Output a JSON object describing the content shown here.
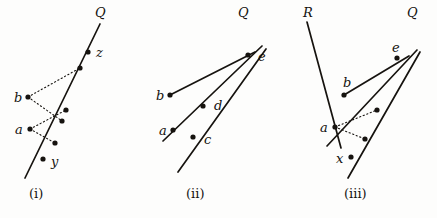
{
  "figure": {
    "width": 437,
    "height": 218,
    "background_color": "#fdfdfc",
    "stroke_color": "#16130f",
    "dot_color": "#16130f",
    "panels": [
      {
        "id": "panel-i",
        "caption": "(i)",
        "caption_pos": {
          "x": 29,
          "y": 187
        },
        "lines": [
          {
            "name": "line-Q",
            "style": "solid",
            "x1": 25,
            "y1": 178,
            "x2": 100,
            "y2": 24
          }
        ],
        "dotted_segments": [
          {
            "name": "dotted-b-to-upper",
            "x1": 28,
            "y1": 97,
            "x2": 80,
            "y2": 68
          },
          {
            "name": "dotted-b-to-lower",
            "x1": 28,
            "y1": 97,
            "x2": 62,
            "y2": 121
          },
          {
            "name": "dotted-a-to-upper",
            "x1": 30,
            "y1": 129,
            "x2": 66,
            "y2": 110
          },
          {
            "name": "dotted-a-to-lower",
            "x1": 30,
            "y1": 129,
            "x2": 55,
            "y2": 143
          }
        ],
        "points": [
          {
            "name": "point-b",
            "x": 28,
            "y": 97,
            "label": "b",
            "label_x": 14,
            "label_y": 91
          },
          {
            "name": "point-a",
            "x": 30,
            "y": 129,
            "label": "a",
            "label_x": 15,
            "label_y": 123
          },
          {
            "name": "point-z-dot",
            "x": 88,
            "y": 52,
            "label": "z",
            "label_x": 96,
            "label_y": 46
          },
          {
            "name": "point-q-upper",
            "x": 80,
            "y": 68,
            "label": "",
            "label_x": 0,
            "label_y": 0
          },
          {
            "name": "point-q-mid-upper",
            "x": 66,
            "y": 110,
            "label": "",
            "label_x": 0,
            "label_y": 0
          },
          {
            "name": "point-q-mid-lower",
            "x": 62,
            "y": 121,
            "label": "",
            "label_x": 0,
            "label_y": 0
          },
          {
            "name": "point-q-lower",
            "x": 55,
            "y": 143,
            "label": "",
            "label_x": 0,
            "label_y": 0
          },
          {
            "name": "point-y-dot",
            "x": 43,
            "y": 159,
            "label": "y",
            "label_x": 51,
            "label_y": 155
          }
        ],
        "line_labels": [
          {
            "name": "label-Q",
            "text": "Q",
            "x": 95,
            "y": 6,
            "style": "italic"
          }
        ]
      },
      {
        "id": "panel-ii",
        "caption": "(ii)",
        "caption_pos": {
          "x": 186,
          "y": 187
        },
        "lines": [
          {
            "name": "line-b-to-e",
            "style": "solid",
            "x1": 170,
            "y1": 95,
            "x2": 255,
            "y2": 52
          },
          {
            "name": "line-a-through-d-to-e",
            "style": "solid",
            "x1": 163,
            "y1": 141,
            "x2": 262,
            "y2": 46
          },
          {
            "name": "line-c-to-e-extended",
            "style": "solid",
            "x1": 178,
            "y1": 172,
            "x2": 266,
            "y2": 49
          }
        ],
        "dotted_segments": [],
        "points": [
          {
            "name": "point-b",
            "x": 170,
            "y": 95,
            "label": "b",
            "label_x": 156,
            "label_y": 89
          },
          {
            "name": "point-a",
            "x": 173,
            "y": 130,
            "label": "a",
            "label_x": 159,
            "label_y": 124
          },
          {
            "name": "point-c",
            "x": 193,
            "y": 137,
            "label": "c",
            "label_x": 204,
            "label_y": 133
          },
          {
            "name": "point-d",
            "x": 203,
            "y": 106,
            "label": "d",
            "label_x": 214,
            "label_y": 99
          },
          {
            "name": "point-e",
            "x": 248,
            "y": 55,
            "label": "e",
            "label_x": 258,
            "label_y": 50
          }
        ],
        "line_labels": [
          {
            "name": "label-Q",
            "text": "Q",
            "x": 238,
            "y": 6,
            "style": "italic"
          }
        ]
      },
      {
        "id": "panel-iii",
        "caption": "(iii)",
        "caption_pos": {
          "x": 344,
          "y": 187
        },
        "lines": [
          {
            "name": "line-R",
            "style": "solid",
            "x1": 307,
            "y1": 22,
            "x2": 341,
            "y2": 148
          },
          {
            "name": "line-b-to-e",
            "style": "solid",
            "x1": 344,
            "y1": 95,
            "x2": 409,
            "y2": 56
          },
          {
            "name": "line-a-to-e",
            "style": "solid",
            "x1": 327,
            "y1": 146,
            "x2": 417,
            "y2": 50
          },
          {
            "name": "line-x-to-e-extended",
            "style": "solid",
            "x1": 348,
            "y1": 178,
            "x2": 420,
            "y2": 52
          }
        ],
        "dotted_segments": [
          {
            "name": "dotted-a-to-upper",
            "x1": 335,
            "y1": 127,
            "x2": 377,
            "y2": 110
          },
          {
            "name": "dotted-a-to-lower",
            "x1": 335,
            "y1": 127,
            "x2": 365,
            "y2": 139
          }
        ],
        "points": [
          {
            "name": "point-b",
            "x": 344,
            "y": 95,
            "label": "b",
            "label_x": 343,
            "label_y": 76
          },
          {
            "name": "point-a",
            "x": 335,
            "y": 127,
            "label": "a",
            "label_x": 320,
            "label_y": 121
          },
          {
            "name": "point-e",
            "x": 397,
            "y": 58,
            "label": "e",
            "label_x": 392,
            "label_y": 41
          },
          {
            "name": "point-x",
            "x": 351,
            "y": 157,
            "label": "x",
            "label_x": 336,
            "label_y": 152
          },
          {
            "name": "point-seg-upper",
            "x": 377,
            "y": 110,
            "label": "",
            "label_x": 0,
            "label_y": 0
          },
          {
            "name": "point-seg-lower",
            "x": 365,
            "y": 139,
            "label": "",
            "label_x": 0,
            "label_y": 0
          }
        ],
        "line_labels": [
          {
            "name": "label-R",
            "text": "R",
            "x": 303,
            "y": 6,
            "style": "italic"
          },
          {
            "name": "label-Q",
            "text": "Q",
            "x": 407,
            "y": 6,
            "style": "italic"
          }
        ]
      }
    ]
  }
}
